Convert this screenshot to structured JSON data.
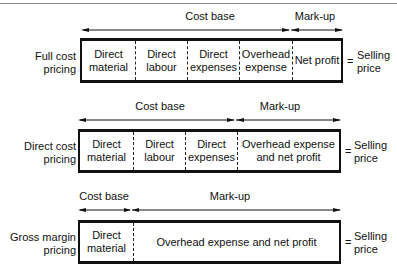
{
  "rows": [
    {
      "label_line1": "Full cost",
      "label_line2": "pricing",
      "cells": [
        {
          "l1": "Direct",
          "l2": "material"
        },
        {
          "l1": "Direct",
          "l2": "labour"
        },
        {
          "l1": "Direct",
          "l2": "expenses"
        },
        {
          "l1": "Overhead",
          "l2": "expense"
        },
        {
          "l1": "Net profit",
          "l2": ""
        }
      ],
      "cost_base_label": "Cost base",
      "markup_label": "Mark-up",
      "equals": "=",
      "result_line1": "Selling",
      "result_line2": "price"
    },
    {
      "label_line1": "Direct cost",
      "label_line2": "pricing",
      "cells": [
        {
          "l1": "Direct",
          "l2": "material"
        },
        {
          "l1": "Direct",
          "l2": "labour"
        },
        {
          "l1": "Direct",
          "l2": "expenses"
        },
        {
          "l1": "Overhead expense",
          "l2": "and net profit"
        }
      ],
      "cost_base_label": "Cost base",
      "markup_label": "Mark-up",
      "equals": "=",
      "result_line1": "Selling",
      "result_line2": "price"
    },
    {
      "label_line1": "Gross margin",
      "label_line2": "pricing",
      "cells": [
        {
          "l1": "Direct",
          "l2": "material"
        },
        {
          "l1": "Overhead expense and net profit",
          "l2": ""
        }
      ],
      "cost_base_label": "Cost base",
      "markup_label": "Mark-up",
      "equals": "=",
      "result_line1": "Selling",
      "result_line2": "price"
    }
  ]
}
